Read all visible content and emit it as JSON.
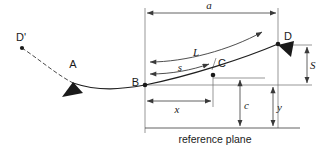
{
  "figure": {
    "type": "engineering-diagram",
    "title_caption": "reference plane",
    "points": [
      {
        "id": "D-prime",
        "label": "D'",
        "x": 22,
        "y": 48,
        "label_x": 18,
        "label_y": 40
      },
      {
        "id": "A",
        "label": "A",
        "x": 73,
        "y": 84,
        "label_x": 68,
        "label_y": 66
      },
      {
        "id": "B",
        "label": "B",
        "x": 145,
        "y": 85,
        "label_x": 129,
        "label_y": 82
      },
      {
        "id": "C",
        "label": "C",
        "x": 213,
        "y": 75,
        "label_x": 220,
        "label_y": 66
      },
      {
        "id": "D",
        "label": "D",
        "x": 278,
        "y": 44,
        "label_x": 285,
        "label_y": 38
      }
    ],
    "dimensions": [
      {
        "id": "a",
        "label": "a",
        "orientation": "horizontal",
        "from_x": 145,
        "to_x": 278,
        "at_y": 13,
        "label_x": 209,
        "label_y": 9
      },
      {
        "id": "L",
        "label": "L",
        "orientation": "arc",
        "label_x": 196,
        "label_y": 56
      },
      {
        "id": "s",
        "label": "s",
        "orientation": "arc",
        "label_x": 180,
        "label_y": 70
      },
      {
        "id": "x",
        "label": "x",
        "orientation": "horizontal",
        "from_x": 145,
        "to_x": 213,
        "at_y": 101,
        "label_x": 177,
        "label_y": 112
      },
      {
        "id": "S",
        "label": "S",
        "orientation": "vertical",
        "at_x": 307,
        "from_y": 45,
        "to_y": 85,
        "label_x": 312,
        "label_y": 69
      },
      {
        "id": "c",
        "label": "c",
        "orientation": "vertical",
        "at_x": 240,
        "from_y": 78,
        "to_y": 128,
        "label_x": 245,
        "label_y": 108
      },
      {
        "id": "y",
        "label": "y",
        "orientation": "vertical",
        "at_x": 273,
        "from_y": 85,
        "to_y": 128,
        "label_x": 278,
        "label_y": 110
      }
    ],
    "markers": [
      {
        "id": "support-A",
        "shape": "triangle",
        "x": 73,
        "y": 85,
        "rotation": -30
      },
      {
        "id": "support-D",
        "shape": "triangle",
        "x": 280,
        "y": 47,
        "rotation": 0
      }
    ],
    "caption": {
      "text": "reference plane",
      "x": 215,
      "y": 143
    },
    "colors": {
      "line": "#3a3a3a",
      "curve": "#1f1f1f",
      "text": "#1a1a1a",
      "background": "#ffffff"
    }
  }
}
